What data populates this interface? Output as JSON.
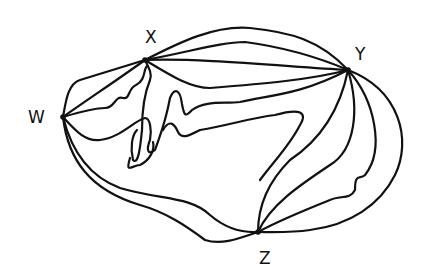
{
  "diagram": {
    "type": "hand-drawn multigraph",
    "vertices": [
      {
        "id": "W",
        "label": "W",
        "x": 63,
        "y": 117
      },
      {
        "id": "X",
        "label": "X",
        "x": 145,
        "y": 60
      },
      {
        "id": "Y",
        "label": "Y",
        "x": 348,
        "y": 70
      },
      {
        "id": "Z",
        "label": "Z",
        "x": 258,
        "y": 232
      }
    ],
    "edges": [
      {
        "from": "W",
        "to": "X",
        "count": 3
      },
      {
        "from": "X",
        "to": "Y",
        "count": 4
      },
      {
        "from": "W",
        "to": "Z",
        "count": 2
      },
      {
        "from": "Y",
        "to": "Z",
        "count": 4
      },
      {
        "from": "X",
        "to": "Y",
        "count_wiggly": 2
      },
      {
        "from": "W",
        "to": "Y",
        "count": 1
      },
      {
        "from": "X",
        "to": "Z",
        "count": 1
      }
    ],
    "stroke_color": "#111111",
    "background": "#ffffff"
  },
  "labels": {
    "w": "W",
    "x": "X",
    "y": "Y",
    "z": "Z"
  }
}
